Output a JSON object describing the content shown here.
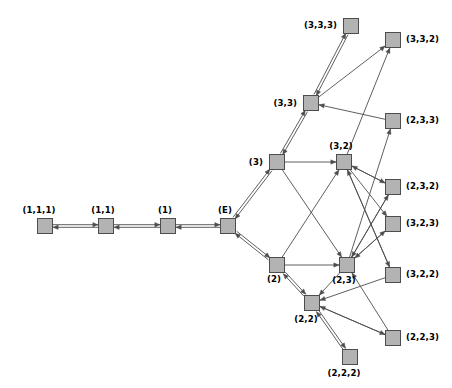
{
  "diagram": {
    "background_color": "#ffffff",
    "node_fill_color": "#b3b3b3",
    "node_stroke_color": "#4d4d4d",
    "edge_color": "#4d4d4d",
    "node_size": 15,
    "nodes": [
      {
        "id": "n111",
        "label": "(1,1,1)",
        "x": 45,
        "y": 226,
        "label_dx": -6,
        "label_dy": -13,
        "label_anchor": "middle"
      },
      {
        "id": "n11",
        "label": "(1,1)",
        "x": 106,
        "y": 226,
        "label_dx": -3,
        "label_dy": -13,
        "label_anchor": "middle"
      },
      {
        "id": "n1",
        "label": "(1)",
        "x": 168,
        "y": 226,
        "label_dx": -3,
        "label_dy": -13,
        "label_anchor": "middle"
      },
      {
        "id": "nE",
        "label": "(E)",
        "x": 228,
        "y": 226,
        "label_dx": -3,
        "label_dy": -13,
        "label_anchor": "middle"
      },
      {
        "id": "n3",
        "label": "(3)",
        "x": 277,
        "y": 162,
        "label_dx": -14,
        "label_dy": 3,
        "label_anchor": "end"
      },
      {
        "id": "n2",
        "label": "(2)",
        "x": 277,
        "y": 265,
        "label_dx": -3,
        "label_dy": 17,
        "label_anchor": "middle"
      },
      {
        "id": "n33",
        "label": "(3,3)",
        "x": 311,
        "y": 103,
        "label_dx": -14,
        "label_dy": 3,
        "label_anchor": "end"
      },
      {
        "id": "n32",
        "label": "(3,2)",
        "x": 344,
        "y": 162,
        "label_dx": -3,
        "label_dy": -13,
        "label_anchor": "middle"
      },
      {
        "id": "n23",
        "label": "(2,3)",
        "x": 347,
        "y": 265,
        "label_dx": -3,
        "label_dy": 18,
        "label_anchor": "middle"
      },
      {
        "id": "n22",
        "label": "(2,2)",
        "x": 312,
        "y": 303,
        "label_dx": -6,
        "label_dy": 19,
        "label_anchor": "middle"
      },
      {
        "id": "n333",
        "label": "(3,3,3)",
        "x": 351,
        "y": 26,
        "label_dx": -14,
        "label_dy": 2,
        "label_anchor": "end"
      },
      {
        "id": "n332",
        "label": "(3,3,2)",
        "x": 393,
        "y": 40,
        "label_dx": 13,
        "label_dy": 2,
        "label_anchor": "start"
      },
      {
        "id": "n233",
        "label": "(2,3,3)",
        "x": 393,
        "y": 121,
        "label_dx": 13,
        "label_dy": 2,
        "label_anchor": "start"
      },
      {
        "id": "n232",
        "label": "(2,3,2)",
        "x": 393,
        "y": 187,
        "label_dx": 13,
        "label_dy": 2,
        "label_anchor": "start"
      },
      {
        "id": "n323",
        "label": "(3,2,3)",
        "x": 393,
        "y": 224,
        "label_dx": 13,
        "label_dy": 2,
        "label_anchor": "start"
      },
      {
        "id": "n322",
        "label": "(3,2,2)",
        "x": 393,
        "y": 275,
        "label_dx": 13,
        "label_dy": 2,
        "label_anchor": "start"
      },
      {
        "id": "n223",
        "label": "(2,2,3)",
        "x": 393,
        "y": 338,
        "label_dx": 13,
        "label_dy": 2,
        "label_anchor": "start"
      },
      {
        "id": "n222",
        "label": "(2,2,2)",
        "x": 350,
        "y": 357,
        "label_dx": -6,
        "label_dy": 19,
        "label_anchor": "middle"
      }
    ],
    "edges": [
      {
        "from": "n111",
        "to": "n11",
        "dir": "both"
      },
      {
        "from": "n11",
        "to": "n1",
        "dir": "both"
      },
      {
        "from": "n1",
        "to": "nE",
        "dir": "both"
      },
      {
        "from": "nE",
        "to": "n3",
        "dir": "both"
      },
      {
        "from": "nE",
        "to": "n2",
        "dir": "both"
      },
      {
        "from": "n3",
        "to": "n33",
        "dir": "both"
      },
      {
        "from": "n3",
        "to": "n32",
        "dir": "forward"
      },
      {
        "from": "n3",
        "to": "n23",
        "dir": "forward"
      },
      {
        "from": "n2",
        "to": "n22",
        "dir": "both"
      },
      {
        "from": "n2",
        "to": "n23",
        "dir": "forward"
      },
      {
        "from": "n2",
        "to": "n32",
        "dir": "forward"
      },
      {
        "from": "n33",
        "to": "n333",
        "dir": "both"
      },
      {
        "from": "n33",
        "to": "n332",
        "dir": "forward"
      },
      {
        "from": "n233",
        "to": "n33",
        "dir": "forward"
      },
      {
        "from": "n32",
        "to": "n332",
        "dir": "forward"
      },
      {
        "from": "n32",
        "to": "n232",
        "dir": "forward"
      },
      {
        "from": "n32",
        "to": "n323",
        "dir": "forward"
      },
      {
        "from": "n32",
        "to": "n322",
        "dir": "forward"
      },
      {
        "from": "n232",
        "to": "n32",
        "dir": "forward"
      },
      {
        "from": "n322",
        "to": "n32",
        "dir": "forward"
      },
      {
        "from": "n23",
        "to": "n233",
        "dir": "forward"
      },
      {
        "from": "n23",
        "to": "n232",
        "dir": "forward"
      },
      {
        "from": "n23",
        "to": "n323",
        "dir": "forward"
      },
      {
        "from": "n323",
        "to": "n23",
        "dir": "forward"
      },
      {
        "from": "n232",
        "to": "n23",
        "dir": "forward"
      },
      {
        "from": "n22",
        "to": "n222",
        "dir": "both"
      },
      {
        "from": "n22",
        "to": "n223",
        "dir": "forward"
      },
      {
        "from": "n223",
        "to": "n22",
        "dir": "forward"
      },
      {
        "from": "n23",
        "to": "n22",
        "dir": "forward"
      },
      {
        "from": "n322",
        "to": "n22",
        "dir": "forward"
      },
      {
        "from": "n223",
        "to": "n23",
        "dir": "forward"
      }
    ]
  }
}
